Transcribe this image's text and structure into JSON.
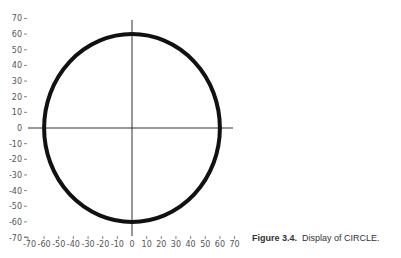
{
  "caption": {
    "label": "Figure 3.4.",
    "text": "Display of CIRCLE."
  },
  "chart_data": {
    "type": "line",
    "title": "",
    "xlabel": "",
    "ylabel": "",
    "xlim": [
      -70,
      70
    ],
    "ylim": [
      -70,
      70
    ],
    "x_ticks": [
      -70,
      -60,
      -50,
      -40,
      -30,
      -20,
      -10,
      0,
      10,
      20,
      30,
      40,
      50,
      60,
      70
    ],
    "y_ticks": [
      70,
      60,
      50,
      40,
      30,
      20,
      10,
      0,
      -10,
      -20,
      -30,
      -40,
      -50,
      -60,
      -70
    ],
    "grid": false,
    "axes_through_origin": true,
    "series": [
      {
        "name": "CIRCLE",
        "shape": "circle",
        "center": [
          0,
          0
        ],
        "radius": 60,
        "color": "#111111"
      }
    ]
  }
}
